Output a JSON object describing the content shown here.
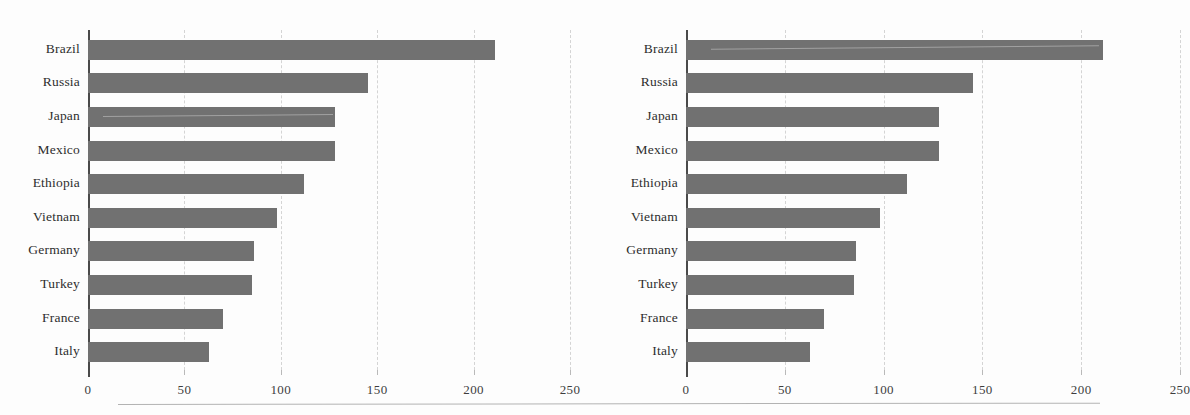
{
  "figure": {
    "background_color": "#fdfdfd",
    "bar_color": "#717171",
    "axis_color": "#4a4a4a",
    "gridline_color": "#d4d4d4",
    "bottom_rule_color": "#b3b3b3"
  },
  "chart_data": [
    {
      "type": "bar",
      "orientation": "horizontal",
      "panel": "left",
      "title": "",
      "subtitle": "",
      "xlabel": "",
      "ylabel": "",
      "categories": [
        "Brazil",
        "Russia",
        "Japan",
        "Mexico",
        "Ethiopia",
        "Vietnam",
        "Germany",
        "Turkey",
        "France",
        "Italy"
      ],
      "values": [
        211,
        145,
        128,
        128,
        112,
        98,
        86,
        85,
        70,
        63
      ],
      "xlim": [
        0,
        250
      ],
      "xticks": [
        0,
        50,
        100,
        150,
        200,
        250
      ],
      "xticklabels": [
        "0",
        "50",
        "100",
        "150",
        "200",
        "250"
      ],
      "grid": true,
      "grid_axis": "x",
      "grid_style": "dashed",
      "legend": false
    },
    {
      "type": "bar",
      "orientation": "horizontal",
      "panel": "right",
      "title": "",
      "subtitle": "",
      "xlabel": "",
      "ylabel": "",
      "categories": [
        "Brazil",
        "Russia",
        "Japan",
        "Mexico",
        "Ethiopia",
        "Vietnam",
        "Germany",
        "Turkey",
        "France",
        "Italy"
      ],
      "values": [
        211,
        145,
        128,
        128,
        112,
        98,
        86,
        85,
        70,
        63
      ],
      "xlim": [
        0,
        250
      ],
      "xticks": [
        0,
        50,
        100,
        150,
        200,
        250
      ],
      "xticklabels": [
        "0",
        "50",
        "100",
        "150",
        "200",
        "250"
      ],
      "grid": true,
      "grid_axis": "x",
      "grid_style": "dashed",
      "legend": false
    }
  ]
}
